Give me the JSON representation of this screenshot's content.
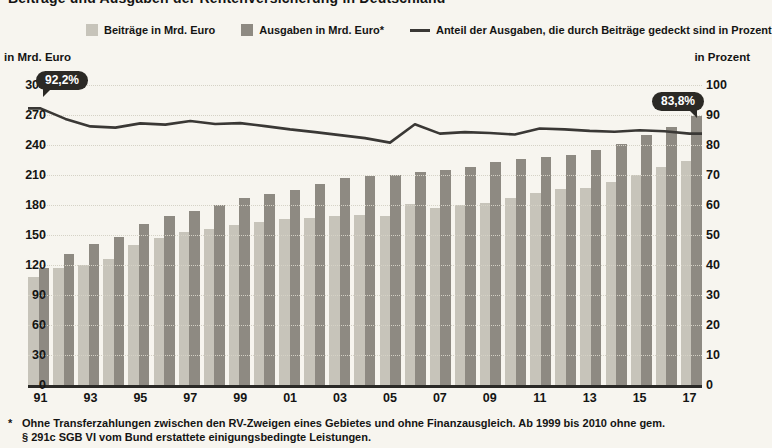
{
  "title": "Beiträge und Ausgaben der Rentenversicherung in Deutschland",
  "legend": [
    {
      "label": "Beiträge in Mrd. Euro",
      "swatch": "light"
    },
    {
      "label": "Ausgaben in Mrd. Euro*",
      "swatch": "dark"
    },
    {
      "label": "Anteil der Ausgaben, die durch Beiträge gedeckt sind in Prozent",
      "swatch": "line"
    }
  ],
  "left_axis_title": "in Mrd. Euro",
  "right_axis_title": "in Prozent",
  "annotations": {
    "start_label": "92,2%",
    "end_label": "83,8%"
  },
  "footnote": {
    "star": "*",
    "line1": "Ohne Transferzahlungen zwischen den RV-Zweigen eines Gebietes und ohne Finanzausgleich. Ab 1999 bis 2010 ohne gem.",
    "line2": "§ 291c SGB VI vom Bund erstattete einigungsbedingte Leistungen."
  },
  "colors": {
    "background": "#f7f5ef",
    "bar_light": "#c7c4ba",
    "bar_dark": "#8e8a82",
    "line": "#3a3835",
    "bubble": "#2b2925",
    "grid": "#d5d2c6",
    "baseline": "#2b2a27",
    "text": "#141413"
  },
  "chart_data": {
    "type": "bar",
    "years": [
      "91",
      "92",
      "93",
      "94",
      "95",
      "96",
      "97",
      "98",
      "99",
      "00",
      "01",
      "02",
      "03",
      "04",
      "05",
      "06",
      "07",
      "08",
      "09",
      "10",
      "11",
      "12",
      "13",
      "14",
      "15",
      "16",
      "17"
    ],
    "x_tick_labels": [
      "91",
      "93",
      "95",
      "97",
      "99",
      "01",
      "03",
      "05",
      "07",
      "09",
      "11",
      "13",
      "15",
      "17"
    ],
    "series": [
      {
        "name": "Beiträge in Mrd. Euro",
        "type": "bar",
        "axis": "left",
        "values": [
          108,
          117,
          120,
          126,
          140,
          147,
          153,
          156,
          160,
          163,
          166,
          167,
          169,
          170,
          169,
          181,
          177,
          180,
          182,
          187,
          192,
          196,
          197,
          203,
          210,
          218,
          224
        ]
      },
      {
        "name": "Ausgaben in Mrd. Euro*",
        "type": "bar",
        "axis": "left",
        "values": [
          117,
          131,
          141,
          148,
          161,
          169,
          174,
          180,
          187,
          191,
          195,
          201,
          207,
          209,
          210,
          213,
          215,
          218,
          223,
          226,
          228,
          230,
          235,
          241,
          250,
          258,
          269
        ]
      },
      {
        "name": "Anteil der Ausgaben, die durch Beiträge gedeckt sind in Prozent",
        "type": "line",
        "axis": "right",
        "values": [
          92.2,
          88.7,
          86.2,
          85.8,
          87.2,
          86.8,
          88.0,
          87.0,
          87.3,
          86.3,
          85.2,
          84.3,
          83.3,
          82.3,
          80.8,
          86.9,
          83.8,
          84.3,
          84.0,
          83.5,
          85.5,
          85.2,
          84.7,
          84.4,
          84.9,
          84.6,
          83.8
        ]
      }
    ],
    "left_axis": {
      "title": "in Mrd. Euro",
      "min": 0,
      "max": 300,
      "step": 30
    },
    "right_axis": {
      "title": "in Prozent",
      "min": 0,
      "max": 100,
      "step": 10
    },
    "grid": "dotted horizontal",
    "legend_position": "top",
    "annotations": [
      {
        "x": "91",
        "series": "Anteil",
        "label": "92,2%"
      },
      {
        "x": "17",
        "series": "Anteil",
        "label": "83,8%"
      }
    ]
  }
}
